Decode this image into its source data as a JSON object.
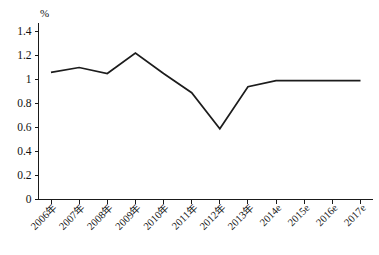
{
  "chart_data": {
    "type": "line",
    "title": "",
    "subtitle": "",
    "xlabel": "",
    "ylabel": "%",
    "unit_label": "%",
    "categories": [
      "2006年",
      "2007年",
      "2008年",
      "2009年",
      "2010年",
      "2011年",
      "2012年",
      "2013年",
      "2014e",
      "2015e",
      "2016e",
      "2017e"
    ],
    "values": [
      1.06,
      1.1,
      1.05,
      1.22,
      1.05,
      0.89,
      0.59,
      0.94,
      0.99,
      0.99,
      0.99,
      0.99
    ],
    "series": [
      {
        "name": "",
        "values": [
          1.06,
          1.1,
          1.05,
          1.22,
          1.05,
          0.89,
          0.59,
          0.94,
          0.99,
          0.99,
          0.99,
          0.99
        ]
      }
    ],
    "ylim": [
      0,
      1.4
    ],
    "ytick_values": [
      0,
      0.2,
      0.4,
      0.6,
      0.8,
      1.0,
      1.2,
      1.4
    ],
    "ytick_labels": [
      "0",
      "0.2",
      "0.4",
      "0.6",
      "0.8",
      "1",
      "1.2",
      "1.4"
    ],
    "grid": false,
    "legend": false,
    "legend_position": "none",
    "line_color": "#1c1c1c",
    "axis_color": "#1a1a1a",
    "background_color": "#ffffff",
    "xtick_rotation_deg": 45,
    "annotations": []
  }
}
